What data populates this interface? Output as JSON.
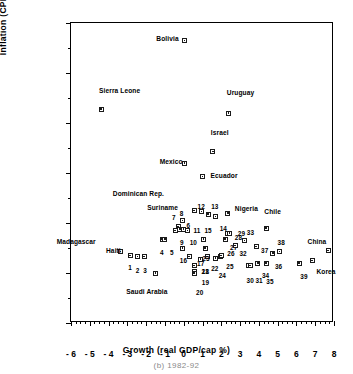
{
  "chart_data": {
    "type": "scatter",
    "title": "",
    "caption": "(b)  1982-92",
    "xlabel": "Growth  (real  GDP/cap  %)",
    "ylabel": "Inflation  (CPI  %)",
    "xlim": [
      -6,
      8
    ],
    "ylim": [
      -20,
      100
    ],
    "xticks": [
      -6,
      -5,
      -4,
      -3,
      -2,
      -1,
      0,
      1,
      2,
      3,
      4,
      5,
      6,
      7,
      8
    ],
    "xtick_labels": [
      "- 6",
      "- 5",
      "- 4",
      "- 3",
      "- 2",
      "- 1",
      "0",
      "1",
      "2",
      "3",
      "4",
      "5",
      "6",
      "7",
      "8"
    ],
    "yticks": [
      -20,
      0,
      20,
      40,
      60,
      80,
      100
    ],
    "ytick_labels": [
      "-20",
      "0",
      "20",
      "40",
      "60",
      "80",
      "100"
    ],
    "x_minor_step": 0.25,
    "y_minor_step": 10,
    "grid": false,
    "legend": false,
    "points": [
      {
        "label": "Bolivia",
        "x": 0.05,
        "y": 93.0,
        "lx": -30,
        "ly": 0.5
      },
      {
        "label": "Sierra Leone",
        "x": -4.4,
        "y": 65.5,
        "lx": -2,
        "ly": 7.5
      },
      {
        "label": "Uruguay",
        "x": 2.4,
        "y": 64.0,
        "lx": -2,
        "ly": 8.0
      },
      {
        "label": "Israel",
        "x": 1.55,
        "y": 48.5,
        "lx": -2,
        "ly": 7.5
      },
      {
        "label": "Mexico",
        "x": 0.05,
        "y": 44.0,
        "lx": -26,
        "ly": 0.5
      },
      {
        "label": "Ecuador",
        "x": 1.0,
        "y": 38.5,
        "lx": 8,
        "ly": 0.5
      },
      {
        "label": "Dominican Rep.",
        "x": 0.55,
        "y": 25.0,
        "lx": -54,
        "ly": 6.5
      },
      {
        "label": "Suriname",
        "x": 0.55,
        "y": 25.0,
        "lx": -40,
        "ly": 1.0
      },
      {
        "label": "Nigeria",
        "x": 2.35,
        "y": 24.0,
        "lx": 7,
        "ly": 1.5
      },
      {
        "label": "Chile",
        "x": 4.4,
        "y": 18.0,
        "lx": -2,
        "ly": 6.5
      },
      {
        "label": "Madagascar",
        "x": -3.35,
        "y": 8.5,
        "lx": -49,
        "ly": 4.0
      },
      {
        "label": "Haiti",
        "x": -3.35,
        "y": 8.5,
        "lx": -24,
        "ly": 0.5
      },
      {
        "label": "China",
        "x": 7.7,
        "y": 9.0,
        "lx": -26,
        "ly": 3.5
      },
      {
        "label": "Korea",
        "x": 6.85,
        "y": 5.0,
        "lx": 4,
        "ly": -4.5
      },
      {
        "label": "Saudi Arabia",
        "x": -1.5,
        "y": 0.0,
        "lx": -12,
        "ly": -7.5
      },
      {
        "label": "1",
        "x": -2.85,
        "y": 7.0,
        "lx": -2,
        "ly": -5.0
      },
      {
        "label": "2",
        "x": -2.45,
        "y": 6.5,
        "lx": -2,
        "ly": -5.5
      },
      {
        "label": "3",
        "x": -2.1,
        "y": 6.5,
        "lx": -1,
        "ly": -5.5
      },
      {
        "label": "4",
        "x": -1.15,
        "y": 13.5,
        "lx": -2,
        "ly": -5.5
      },
      {
        "label": "5",
        "x": -1.0,
        "y": 13.5,
        "lx": 5,
        "ly": -5.5
      },
      {
        "label": "6",
        "x": -0.45,
        "y": 17.0,
        "lx": -9,
        "ly": 2.0
      },
      {
        "label": "7",
        "x": -0.3,
        "y": 18.5,
        "lx": -6,
        "ly": 3.5
      },
      {
        "label": "8",
        "x": -0.05,
        "y": 21.0,
        "lx": -3,
        "ly": 2.5
      },
      {
        "label": "9",
        "x": -0.2,
        "y": 17.5,
        "lx": 0,
        "ly": -5.5
      },
      {
        "label": "10",
        "x": 0.0,
        "y": 17.5,
        "lx": 6,
        "ly": -5.5
      },
      {
        "label": "11",
        "x": 0.2,
        "y": 17.0,
        "lx": 6,
        "ly": 0.0
      },
      {
        "label": "12",
        "x": 0.95,
        "y": 24.5,
        "lx": -4,
        "ly": 2.0
      },
      {
        "label": "13",
        "x": 1.3,
        "y": 23.5,
        "lx": 3,
        "ly": 3.0
      },
      {
        "label": "14",
        "x": 1.7,
        "y": 22.5,
        "lx": 4,
        "ly": -5.0
      },
      {
        "label": "15",
        "x": 1.05,
        "y": 13.5,
        "lx": 1,
        "ly": 3.5
      },
      {
        "label": "16",
        "x": -0.05,
        "y": 10.0,
        "lx": -3,
        "ly": -5.0
      },
      {
        "label": "17",
        "x": 0.3,
        "y": 6.5,
        "lx": -9,
        "ly": -3.0
      },
      {
        "label": "18",
        "x": 0.55,
        "y": 3.0,
        "lx": -9,
        "ly": -2.5
      },
      {
        "label": "19",
        "x": 0.55,
        "y": 0.5,
        "lx": -9,
        "ly": -4.5
      },
      {
        "label": "20",
        "x": 0.55,
        "y": 0.0,
        "lx": 2,
        "ly": -8.0
      },
      {
        "label": "21",
        "x": 0.9,
        "y": 5.5,
        "lx": 1,
        "ly": -5.0
      },
      {
        "label": "22",
        "x": 1.25,
        "y": 6.5,
        "lx": 4,
        "ly": -5.0
      },
      {
        "label": "23",
        "x": 1.15,
        "y": 10.0,
        "lx": -3,
        "ly": -4.5
      },
      {
        "label": "24",
        "x": 1.7,
        "y": 6.0,
        "lx": 3,
        "ly": -7.0
      },
      {
        "label": "25",
        "x": 1.95,
        "y": 6.5,
        "lx": 6,
        "ly": -4.0
      },
      {
        "label": "26",
        "x": 2.0,
        "y": 7.0,
        "lx": 6,
        "ly": 0.5
      },
      {
        "label": "27",
        "x": 2.2,
        "y": 13.5,
        "lx": 5,
        "ly": -3.5
      },
      {
        "label": "28",
        "x": 2.35,
        "y": 16.0,
        "lx": 7,
        "ly": -2.0
      },
      {
        "label": "29",
        "x": 2.45,
        "y": 16.0,
        "lx": 8,
        "ly": -0.5
      },
      {
        "label": "30",
        "x": 3.45,
        "y": 3.0,
        "lx": -2,
        "ly": -6.0
      },
      {
        "label": "31",
        "x": 3.55,
        "y": 3.0,
        "lx": 5,
        "ly": -6.0
      },
      {
        "label": "32",
        "x": 2.75,
        "y": 11.0,
        "lx": 4,
        "ly": -3.5
      },
      {
        "label": "33",
        "x": 3.25,
        "y": 13.0,
        "lx": 2,
        "ly": 3.0
      },
      {
        "label": "34",
        "x": 3.95,
        "y": 4.0,
        "lx": 4,
        "ly": -5.0
      },
      {
        "label": "35",
        "x": 4.4,
        "y": 4.0,
        "lx": 0,
        "ly": -7.5
      },
      {
        "label": "36",
        "x": 4.75,
        "y": 8.0,
        "lx": 2,
        "ly": -5.5
      },
      {
        "label": "37",
        "x": 3.85,
        "y": 10.5,
        "lx": 5,
        "ly": -1.5
      },
      {
        "label": "38",
        "x": 5.1,
        "y": 8.5,
        "lx": -2,
        "ly": 3.5
      },
      {
        "label": "39",
        "x": 6.15,
        "y": 4.0,
        "lx": 1,
        "ly": -5.5
      }
    ]
  }
}
